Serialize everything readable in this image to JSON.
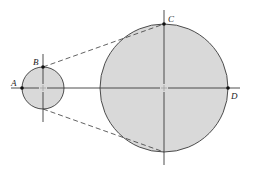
{
  "diagram": {
    "colors": {
      "fill": "#d9d9d9",
      "stroke": "#3a3a3a",
      "background": "#ffffff"
    },
    "small_circle": {
      "cx": 43,
      "cy": 88,
      "r": 21
    },
    "large_circle": {
      "cx": 164,
      "cy": 88,
      "r": 64
    },
    "points": [
      {
        "id": "A",
        "label": "A",
        "x": 22,
        "y": 88
      },
      {
        "id": "B",
        "label": "B",
        "x": 43,
        "y": 67
      },
      {
        "id": "C",
        "label": "C",
        "x": 164,
        "y": 24
      },
      {
        "id": "D",
        "label": "D",
        "x": 228,
        "y": 88
      }
    ]
  }
}
